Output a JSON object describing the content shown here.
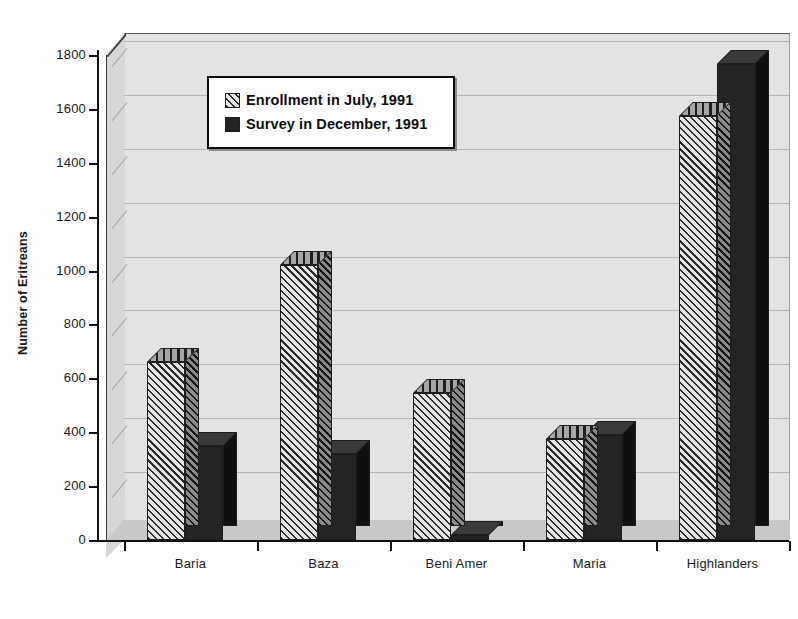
{
  "page": {
    "clipped_header_text": ""
  },
  "chart_data": {
    "type": "bar",
    "title": "",
    "subtitle": "",
    "xlabel": "",
    "ylabel": "Number of Eritreans",
    "categories": [
      "Baria",
      "Baza",
      "Beni Amer",
      "Maria",
      "Highlanders"
    ],
    "series": [
      {
        "name": "Enrollment in July, 1991",
        "swatch": "hatched",
        "color": "#dcdcda",
        "values": [
          660,
          1020,
          545,
          375,
          1575
        ]
      },
      {
        "name": "Survey in December, 1991",
        "swatch": "solid",
        "color": "#242424",
        "values": [
          350,
          320,
          20,
          390,
          1765
        ]
      }
    ],
    "ylim": [
      0,
      1800
    ],
    "ytick_step": 200,
    "yticks": [
      0,
      200,
      400,
      600,
      800,
      1000,
      1200,
      1400,
      1600,
      1800
    ],
    "ytick_labels": [
      "0",
      "200",
      "400",
      "600",
      "800",
      "1000",
      "1200",
      "1400",
      "1600",
      "1800"
    ],
    "grid": true,
    "grid_axis": "y",
    "legend_position": "upper-left-inside",
    "three_d": true,
    "plot_background": "#e3e3e1"
  },
  "legend": {
    "entries": [
      {
        "label": "Enrollment in July, 1991",
        "swatch": "hatch-swatch"
      },
      {
        "label": "Survey in December, 1991",
        "swatch": "solid-swatch"
      }
    ]
  }
}
